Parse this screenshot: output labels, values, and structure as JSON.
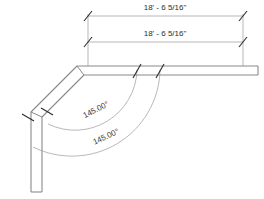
{
  "drawing": {
    "title": "duct-run-plan",
    "background_color": "#ffffff",
    "line_color": "#8a8a8a",
    "dim_line_color": "#9a9a9a",
    "tick_color": "#2b2b2b",
    "text_color": "#2b2b2b",
    "arc_color": "#9a9a9a"
  },
  "dimensions": {
    "linear": [
      {
        "name": "overall-length-upper",
        "value": "18' - 6 5/16\"",
        "orientation": "horizontal"
      },
      {
        "name": "overall-length-lower",
        "value": "18' - 6 5/16\"",
        "orientation": "horizontal"
      }
    ],
    "angular": [
      {
        "name": "elbow-angle-inner",
        "value": "145.00°"
      },
      {
        "name": "elbow-angle-outer",
        "value": "145.00°"
      }
    ]
  }
}
